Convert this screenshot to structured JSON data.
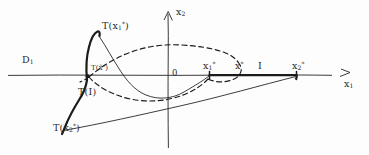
{
  "figure": {
    "kind": "hand-drawn mathematical diagram",
    "background_color": "#fdfdfd",
    "ink_color": "#1b1b1b",
    "axis_color": "#3a3a3a"
  },
  "axes": {
    "vertical_label": "x",
    "vertical_sub": "2",
    "horizontal_label": "x",
    "horizontal_sub": "1",
    "origin_label": "0",
    "origin_px": {
      "x": 168,
      "y": 75
    },
    "x_axis_arrow_glyph": ">",
    "y_axis_arrow": "up"
  },
  "labels": [
    {
      "id": "domain-line",
      "base": "D",
      "sub": "1",
      "sup": "",
      "x": 22,
      "y": 61,
      "size": "sz-md"
    },
    {
      "id": "image-x1-star",
      "base": "T(x",
      "sub": "1",
      "sup": "*",
      "tail": ")",
      "x": 102,
      "y": 27,
      "size": "sz-md"
    },
    {
      "id": "image-xbar-star",
      "base": "T(x̄",
      "sub": "",
      "sup": "*",
      "tail": ")",
      "x": 91,
      "y": 65,
      "size": "sz-xs"
    },
    {
      "id": "image-interval",
      "base": "T(I)",
      "sub": "",
      "sup": "",
      "x": 78,
      "y": 92,
      "size": "sz-md"
    },
    {
      "id": "image-x2-star",
      "base": "T(x",
      "sub": "2",
      "sup": "*",
      "tail": ")",
      "x": 53,
      "y": 124,
      "size": "sz-md"
    },
    {
      "id": "point-x1-star",
      "base": "x",
      "sub": "1",
      "sup": "*",
      "x": 203,
      "y": 63,
      "size": "sz-md"
    },
    {
      "id": "point-x-star",
      "base": "x",
      "sub": "",
      "sup": "*",
      "x": 235,
      "y": 63,
      "size": "sz-md"
    },
    {
      "id": "interval-I",
      "base": "I",
      "sub": "",
      "sup": "",
      "x": 256,
      "y": 63,
      "size": "sz-md"
    },
    {
      "id": "point-x2-star",
      "base": "x",
      "sub": "2",
      "sup": "*",
      "x": 292,
      "y": 63,
      "size": "sz-md"
    }
  ],
  "marked_points": [
    {
      "name": "left-crossing",
      "x": 88,
      "y": 75
    },
    {
      "name": "x1-star",
      "x": 209,
      "y": 75
    },
    {
      "name": "x2-star",
      "x": 297,
      "y": 75
    }
  ],
  "interval": {
    "name": "I",
    "from_label": "x1*",
    "to_label": "x2*",
    "from_px": 209,
    "to_px": 297,
    "axis_y": 75,
    "style": "thick solid segment on the x1 axis"
  },
  "curves": [
    {
      "name": "T-of-x1-star-peak",
      "style": "thick",
      "note": "steep peak rising from the axis crossing up to the T(x1*) label"
    },
    {
      "name": "T-of-interval",
      "style": "thick",
      "note": "thick arc descending left-down from the crossing to T(x2*)"
    },
    {
      "name": "descending-thin",
      "style": "thin",
      "note": "thin curve from the peak sweeping right and down through the axis"
    },
    {
      "name": "lower-sweep-thin",
      "style": "thin",
      "note": "thin curve from T(x2*) sweeping right up to x2* on the axis"
    },
    {
      "name": "dashed-lens-upper",
      "style": "dashed",
      "note": "upper dashed lobe of the closed region"
    },
    {
      "name": "dashed-lens-lower",
      "style": "dashed",
      "note": "lower dashed lobe of the closed region"
    },
    {
      "name": "dashed-right-loop",
      "style": "dashed",
      "note": "small dashed loop around x1* on the right"
    }
  ]
}
